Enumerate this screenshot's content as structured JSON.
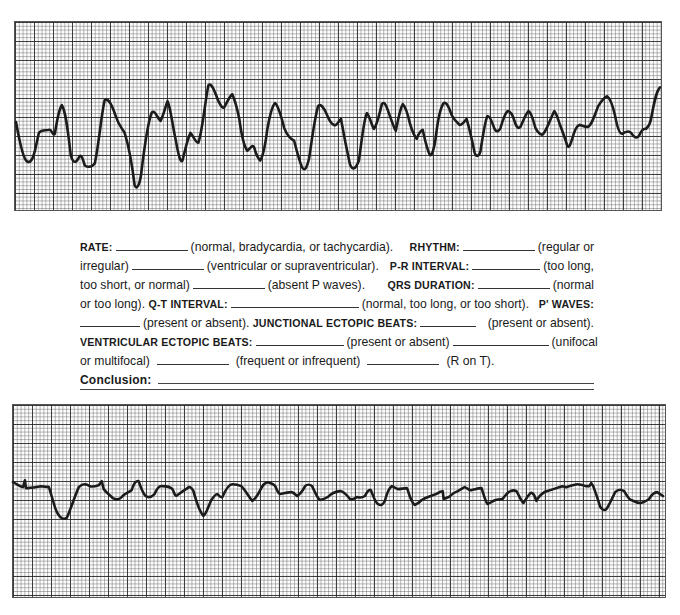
{
  "strips": [
    {
      "id": "top",
      "description": "Rhythm strip 1 — wide, bizarre, irregular complexes",
      "grid": {
        "major_px": 19,
        "minor_per_major": 5
      }
    },
    {
      "id": "bottom",
      "description": "Rhythm strip 2 — low amplitude, irregular undulating baseline",
      "grid": {
        "major_px": 19,
        "minor_per_major": 5
      }
    }
  ],
  "worksheet": {
    "lines": [
      [
        "RATE:",
        "(normal, bradycardia, or tachycardia).",
        "RHYTHM:",
        "(regular or"
      ],
      [
        "irregular)",
        "(ventricular or supraventricular).",
        "P-R INTERVAL:",
        "(too long,"
      ],
      [
        "too short, or normal)",
        "(absent P waves).",
        "QRS DURATION:",
        "(normal"
      ],
      [
        "or too long).",
        "Q-T INTERVAL:",
        "(normal, too long, or too short).",
        "P' WAVES:"
      ],
      [
        "(present or absent).",
        "JUNCTIONAL ECTOPIC BEATS:",
        "(present or absent)."
      ],
      [
        "VENTRICULAR ECTOPIC BEATS:",
        "(present or absent)",
        "(unifocal"
      ],
      [
        "or multifocal)",
        "(frequent or infrequent)",
        "(R on T)."
      ]
    ],
    "conclusion_label": "Conclusion:"
  }
}
